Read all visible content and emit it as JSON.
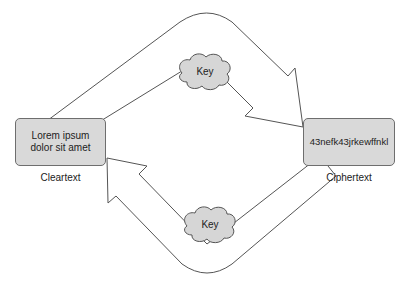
{
  "nodes": {
    "cleartext": {
      "content": "Lorem ipsum dolor sit amet",
      "content_line1": "Lorem ipsum",
      "content_line2": "dolor sit amet",
      "label": "Cleartext"
    },
    "ciphertext": {
      "content": "43nefk43jrkewffnkl",
      "label": "Ciphertext"
    }
  },
  "keys": {
    "top": {
      "label": "Key"
    },
    "bottom": {
      "label": "Key"
    }
  },
  "colors": {
    "box_fill": "#d9d9d9",
    "box_border": "#6e6e6e",
    "cloud_fill": "#d6d6d6",
    "arrow_stroke": "#555555",
    "arrow_fill": "#ffffff"
  }
}
